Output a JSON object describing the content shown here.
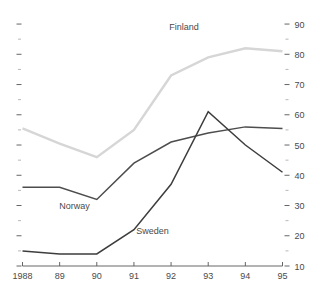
{
  "chart_data": {
    "type": "line",
    "title": "",
    "subtitle": "",
    "xlabel": "",
    "ylabel": "",
    "x": [
      1988,
      1989,
      1990,
      1991,
      1992,
      1993,
      1994,
      1995
    ],
    "categories": [
      "1988",
      "89",
      "90",
      "91",
      "92",
      "93",
      "94",
      "95"
    ],
    "xtick_labels": [
      "1988",
      "89",
      "90",
      "91",
      "92",
      "93",
      "94",
      "95"
    ],
    "ytick_labels": [
      "90",
      "80",
      "70",
      "60",
      "50",
      "40",
      "30",
      "20",
      "10"
    ],
    "ytick_values": [
      90,
      80,
      70,
      60,
      50,
      40,
      30,
      20,
      10
    ],
    "yminor_values": [
      85,
      75,
      65,
      55,
      45,
      35,
      25,
      15
    ],
    "ylim": [
      10,
      92
    ],
    "xlim": [
      1988,
      1995
    ],
    "grid": false,
    "legend": "inline-labels",
    "y_axis_position": "right",
    "series": [
      {
        "name": "Finland",
        "color": "#d6d6d6",
        "values": [
          55.5,
          50.5,
          46.0,
          55.0,
          73.0,
          79.0,
          82.0,
          81.0
        ],
        "label_x": 1992.35,
        "label_y": 88.0
      },
      {
        "name": "Norway",
        "color": "#4d4d4d",
        "values": [
          36.0,
          36.0,
          32.0,
          44.0,
          51.0,
          54.0,
          56.0,
          55.5
        ],
        "label_x": 1989.4,
        "label_y": 29.0
      },
      {
        "name": "Sweden",
        "color": "#3d3d3d",
        "values": [
          15.0,
          14.0,
          14.0,
          22.0,
          37.0,
          61.0,
          50.0,
          41.0
        ],
        "label_x": 1991.5,
        "label_y": 20.5
      }
    ]
  },
  "colors": {
    "background": "#ffffff",
    "axis": "#555555",
    "tick_minor": "#999999",
    "text": "#4a4a4a",
    "finland": "#d6d6d6",
    "norway": "#4d4d4d",
    "sweden": "#3d3d3d"
  }
}
